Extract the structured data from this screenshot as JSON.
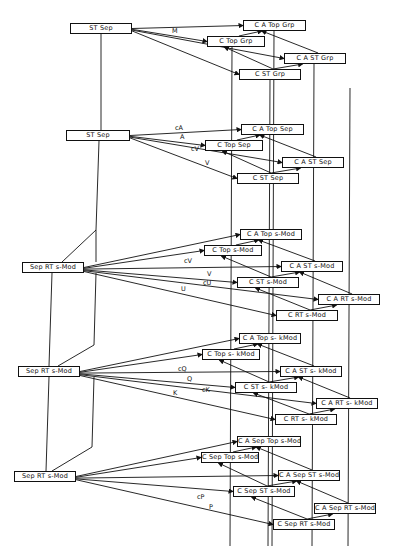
{
  "diagram": {
    "groups": [
      {
        "source": {
          "label": "ST Sep",
          "x": 70,
          "y": 23,
          "w": 62
        },
        "targets": [
          {
            "id": "cat",
            "label": "C A Top Grp",
            "x": 243,
            "y": 20,
            "w": 63
          },
          {
            "id": "ct",
            "label": "C Top Grp",
            "x": 207,
            "y": 36,
            "w": 58
          },
          {
            "id": "cas",
            "label": "C A ST Grp",
            "x": 284,
            "y": 53,
            "w": 62
          },
          {
            "id": "cs",
            "label": "C ST Grp",
            "x": 239,
            "y": 69,
            "w": 62
          }
        ],
        "edges": [
          {
            "label": "M",
            "to": "cat",
            "lx": 172,
            "ly": 28
          },
          {
            "label": "",
            "to": "ct"
          },
          {
            "label": "",
            "to": "cas"
          },
          {
            "label": "",
            "to": "cs"
          }
        ]
      },
      {
        "source": {
          "label": "ST Sep",
          "x": 66,
          "y": 130,
          "w": 64
        },
        "targets": [
          {
            "id": "cat",
            "label": "C A Top Sep",
            "x": 241,
            "y": 124,
            "w": 63
          },
          {
            "id": "ct",
            "label": "C Top Sep",
            "x": 205,
            "y": 140,
            "w": 58
          },
          {
            "id": "cas",
            "label": "C A ST Sep",
            "x": 282,
            "y": 157,
            "w": 62
          },
          {
            "id": "cs",
            "label": "C ST Sep",
            "x": 237,
            "y": 173,
            "w": 62
          }
        ],
        "edges": [
          {
            "label": "cA",
            "to": "cat",
            "lx": 175,
            "ly": 125
          },
          {
            "label": "A",
            "to": "ct",
            "lx": 180,
            "ly": 134
          },
          {
            "label": "cV",
            "to": "cas",
            "lx": 191,
            "ly": 146
          },
          {
            "label": "V",
            "to": "cs",
            "lx": 205,
            "ly": 160
          }
        ]
      },
      {
        "source": {
          "label": "Sep RT s-Mod",
          "x": 22,
          "y": 262,
          "w": 62
        },
        "targets": [
          {
            "id": "cat",
            "label": "C A Top s-Mod",
            "x": 240,
            "y": 229,
            "w": 62
          },
          {
            "id": "ct",
            "label": "C Top s-Mod",
            "x": 204,
            "y": 245,
            "w": 58
          },
          {
            "id": "cas",
            "label": "C A ST s-Mod",
            "x": 281,
            "y": 261,
            "w": 62
          },
          {
            "id": "cs",
            "label": "C ST s-Mod",
            "x": 237,
            "y": 277,
            "w": 62
          },
          {
            "id": "car",
            "label": "C A RT s-Mod",
            "x": 318,
            "y": 294,
            "w": 62
          },
          {
            "id": "cr",
            "label": "C RT s-Mod",
            "x": 276,
            "y": 310,
            "w": 62
          }
        ],
        "edges": [
          {
            "label": "",
            "to": "cat"
          },
          {
            "label": "",
            "to": "ct"
          },
          {
            "label": "cV",
            "to": "cas",
            "lx": 184,
            "ly": 258
          },
          {
            "label": "V",
            "to": "cs",
            "lx": 207,
            "ly": 271
          },
          {
            "label": "cU",
            "to": "car",
            "lx": 203,
            "ly": 280
          },
          {
            "label": "U",
            "to": "cr",
            "lx": 181,
            "ly": 286
          }
        ]
      },
      {
        "source": {
          "label": "Sep RT s-Mod",
          "x": 18,
          "y": 366,
          "w": 62
        },
        "targets": [
          {
            "id": "cat",
            "label": "C A Top s- kMod",
            "x": 239,
            "y": 333,
            "w": 62
          },
          {
            "id": "ct",
            "label": "C Top s- kMod",
            "x": 202,
            "y": 349,
            "w": 58
          },
          {
            "id": "cas",
            "label": "C A ST s- kMod",
            "x": 280,
            "y": 366,
            "w": 62
          },
          {
            "id": "cs",
            "label": "C ST s- kMod",
            "x": 235,
            "y": 382,
            "w": 62
          },
          {
            "id": "car",
            "label": "C A RT s- kMod",
            "x": 316,
            "y": 398,
            "w": 62
          },
          {
            "id": "cr",
            "label": "C RT s- kMod",
            "x": 275,
            "y": 414,
            "w": 62
          }
        ],
        "edges": [
          {
            "label": "",
            "to": "cat"
          },
          {
            "label": "",
            "to": "ct"
          },
          {
            "label": "cQ",
            "to": "cas",
            "lx": 178,
            "ly": 366
          },
          {
            "label": "Q",
            "to": "cs",
            "lx": 187,
            "ly": 376
          },
          {
            "label": "cK",
            "to": "car",
            "lx": 202,
            "ly": 387
          },
          {
            "label": "K",
            "to": "cr",
            "lx": 173,
            "ly": 390
          }
        ]
      },
      {
        "source": {
          "label": "Sep RT s-Mod",
          "x": 14,
          "y": 471,
          "w": 62
        },
        "targets": [
          {
            "id": "cat",
            "label": "C A Sep Top s-Mod",
            "x": 237,
            "y": 436,
            "w": 64
          },
          {
            "id": "ct",
            "label": "C Sep Top s-Mod",
            "x": 201,
            "y": 452,
            "w": 58
          },
          {
            "id": "cas",
            "label": "C A Sep ST s-Mod",
            "x": 278,
            "y": 470,
            "w": 62
          },
          {
            "id": "cs",
            "label": "C Sep ST s-Mod",
            "x": 233,
            "y": 486,
            "w": 62
          },
          {
            "id": "car",
            "label": "C A Sep RT s-Mod",
            "x": 314,
            "y": 503,
            "w": 62
          },
          {
            "id": "cr",
            "label": "C Sep RT s-Mod",
            "x": 273,
            "y": 519,
            "w": 62
          }
        ],
        "edges": [
          {
            "label": "",
            "to": "cat"
          },
          {
            "label": "",
            "to": "ct"
          },
          {
            "label": "",
            "to": "cas"
          },
          {
            "label": "cP",
            "to": "cs",
            "lx": 197,
            "ly": 494
          },
          {
            "label": "P",
            "to": "cr",
            "lx": 209,
            "ly": 504
          }
        ]
      }
    ]
  }
}
